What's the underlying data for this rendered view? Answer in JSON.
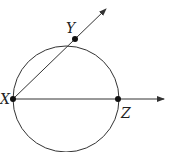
{
  "diagram": {
    "title": "",
    "circle": {
      "cx": 66,
      "cy": 99,
      "r": 53,
      "stroke": "#333333"
    },
    "points": [
      {
        "name": "X",
        "x": 13,
        "y": 99,
        "label_x": 0,
        "label_y": 104
      },
      {
        "name": "Y",
        "x": 75,
        "y": 39,
        "label_x": 66,
        "label_y": 33
      },
      {
        "name": "Z",
        "x": 118,
        "y": 99,
        "label_x": 121,
        "label_y": 118
      }
    ],
    "rays": [
      {
        "name": "ray-XY",
        "from": "X",
        "through": "Y",
        "x1": 13,
        "y1": 99,
        "x2": 106,
        "y2": 9
      },
      {
        "name": "ray-XZ",
        "from": "X",
        "through": "Z",
        "x1": 13,
        "y1": 99,
        "x2": 164,
        "y2": 99
      }
    ],
    "colors": {
      "line": "#333333",
      "point": "#111111",
      "background": "#ffffff"
    }
  }
}
